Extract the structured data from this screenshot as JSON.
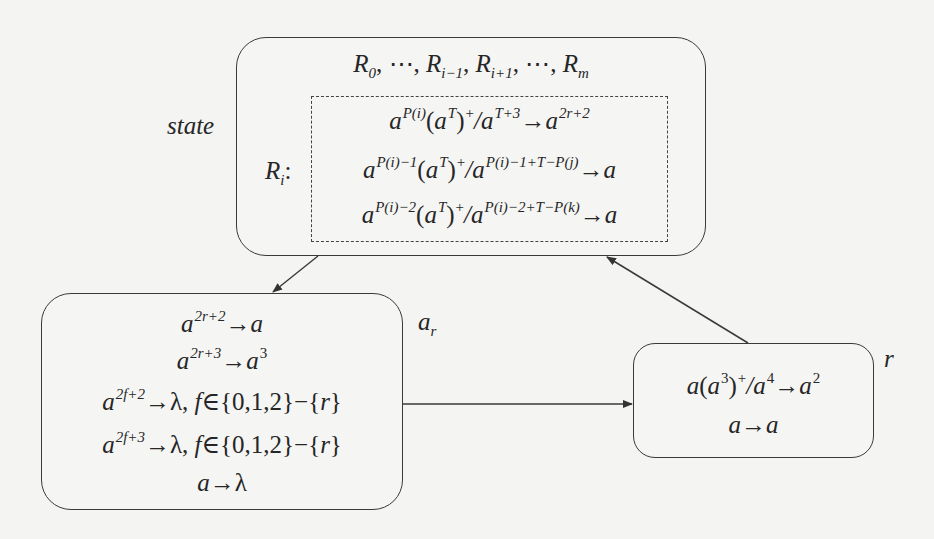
{
  "diagram": {
    "type": "state-transition",
    "nodes": {
      "state": {
        "label": "state",
        "header": "R0, ⋯, Ri−1, Ri+1, ⋯, Rm",
        "group_label": "Ri:",
        "rules": [
          "a^{P(i)} (a^T)^+ / a^{T+3} → a^{2r+2}",
          "a^{P(i)−1} (a^T)^+ / a^{P(i)−1+T−P(j)} → a",
          "a^{P(i)−2} (a^T)^+ / a^{P(i)−2+T−P(k)} → a"
        ]
      },
      "a_r": {
        "label": "a_r",
        "rules": [
          "a^{2r+2} → a",
          "a^{2r+3} → a^3",
          "a^{2f+2} → λ, f ∈ {0,1,2} − {r}",
          "a^{2f+3} → λ, f ∈ {0,1,2} − {r}",
          "a → λ"
        ]
      },
      "r": {
        "label": "r",
        "rules": [
          "a (a^3)^+ / a^4 → a^2",
          "a → a"
        ]
      }
    },
    "edges": [
      {
        "from": "state",
        "to": "a_r"
      },
      {
        "from": "a_r",
        "to": "r"
      },
      {
        "from": "r",
        "to": "state"
      }
    ]
  },
  "text": {
    "state_label": "state",
    "ar_base": "a",
    "ar_sub": "r",
    "r_label": "r",
    "R": "R",
    "sub_0": "0",
    "sub_im1": "i−1",
    "sub_ip1": "i+1",
    "sub_m": "m",
    "sub_i": "i",
    "comma": ",",
    "dots": "⋯",
    "colon": ":",
    "a": "a",
    "arrow": "→",
    "slash": "/",
    "lambda": "λ",
    "plus": "+",
    "T": "T",
    "sup_Pi": "P(i)",
    "sup_T3": "T+3",
    "sup_2r2": "2r+2",
    "sup_Pi1": "P(i)−1",
    "sup_Pi1TPj": "P(i)−1+T−P(j)",
    "sup_Pi2": "P(i)−2",
    "sup_Pi2TPk": "P(i)−2+T−P(k)",
    "sup_2r3": "2r+3",
    "sup_3": "3",
    "sup_2f2": "2f+2",
    "sup_2f3": "2f+3",
    "sup_4": "4",
    "sup_2": "2",
    "f": "f",
    "elem": "∈",
    "set012": "{0,1,2}",
    "minus": "−",
    "setr_open": "{",
    "r": "r",
    "setr_close": "}",
    "lp": "(",
    "rp": ")"
  },
  "colors": {
    "stroke": "#3a3a3a",
    "text": "#262626",
    "background": "#f4f4f2"
  }
}
